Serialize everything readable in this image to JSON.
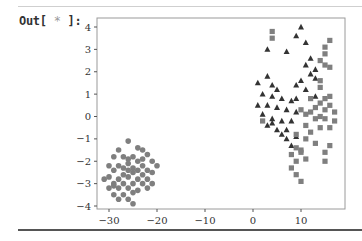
{
  "cell": {
    "prompt_prefix": "Out[",
    "prompt_star": "*",
    "prompt_suffix": "]:"
  },
  "chart_data": {
    "type": "scatter",
    "title": "",
    "xlabel": "",
    "ylabel": "",
    "xlim": [
      -33,
      18
    ],
    "ylim": [
      -4.1,
      4.3
    ],
    "xticks": [
      -30,
      -20,
      -10,
      0,
      10
    ],
    "yticks": [
      4,
      3,
      2,
      1,
      0,
      -1,
      -2,
      -3,
      -4
    ],
    "grid": false,
    "legend": null,
    "series": [
      {
        "name": "circles",
        "marker": "circle",
        "color": "#7f7f7f",
        "points": [
          [
            -26,
            -1.1
          ],
          [
            -28,
            -1.5
          ],
          [
            -24,
            -1.4
          ],
          [
            -23,
            -1.5
          ],
          [
            -22,
            -1.7
          ],
          [
            -25,
            -1.8
          ],
          [
            -27,
            -1.8
          ],
          [
            -29,
            -1.8
          ],
          [
            -26,
            -1.9
          ],
          [
            -23,
            -1.9
          ],
          [
            -21,
            -2.0
          ],
          [
            -20,
            -2.2
          ],
          [
            -24,
            -2.0
          ],
          [
            -26,
            -2.1
          ],
          [
            -28,
            -2.2
          ],
          [
            -30,
            -2.2
          ],
          [
            -27,
            -2.3
          ],
          [
            -25,
            -2.3
          ],
          [
            -23,
            -2.2
          ],
          [
            -22,
            -2.4
          ],
          [
            -29,
            -2.4
          ],
          [
            -25,
            -2.5
          ],
          [
            -27,
            -2.6
          ],
          [
            -30,
            -2.7
          ],
          [
            -31,
            -2.8
          ],
          [
            -28,
            -2.8
          ],
          [
            -26,
            -2.7
          ],
          [
            -24,
            -2.8
          ],
          [
            -22,
            -2.8
          ],
          [
            -23,
            -2.6
          ],
          [
            -29,
            -3.0
          ],
          [
            -27,
            -3.0
          ],
          [
            -25,
            -3.0
          ],
          [
            -23,
            -3.0
          ],
          [
            -21,
            -3.0
          ],
          [
            -30,
            -3.2
          ],
          [
            -28,
            -3.2
          ],
          [
            -26,
            -3.2
          ],
          [
            -24,
            -3.3
          ],
          [
            -22,
            -3.2
          ],
          [
            -29,
            -3.5
          ],
          [
            -27,
            -3.5
          ],
          [
            -25,
            -3.4
          ],
          [
            -28,
            -3.7
          ],
          [
            -26,
            -3.7
          ],
          [
            -25,
            -3.9
          ],
          [
            -29,
            -3.1
          ],
          [
            -24,
            -2.4
          ],
          [
            -21,
            -2.5
          ],
          [
            -26,
            -2.4
          ]
        ]
      },
      {
        "name": "triangles",
        "marker": "triangle",
        "color": "#333333",
        "points": [
          [
            10,
            4.0
          ],
          [
            9,
            3.6
          ],
          [
            11,
            3.3
          ],
          [
            3,
            3.0
          ],
          [
            7,
            2.9
          ],
          [
            12,
            2.6
          ],
          [
            11,
            2.3
          ],
          [
            13,
            2.1
          ],
          [
            12,
            1.9
          ],
          [
            13,
            1.7
          ],
          [
            3,
            1.8
          ],
          [
            1,
            1.5
          ],
          [
            4,
            1.4
          ],
          [
            5,
            1.2
          ],
          [
            9,
            1.4
          ],
          [
            10,
            1.6
          ],
          [
            11,
            1.2
          ],
          [
            2,
            1.0
          ],
          [
            4,
            0.9
          ],
          [
            6,
            0.8
          ],
          [
            8,
            0.7
          ],
          [
            9,
            0.8
          ],
          [
            13,
            0.9
          ],
          [
            1,
            0.5
          ],
          [
            3,
            0.5
          ],
          [
            5,
            0.4
          ],
          [
            7,
            0.3
          ],
          [
            9,
            0.2
          ],
          [
            2,
            0.1
          ],
          [
            4,
            -0.1
          ],
          [
            6,
            -0.2
          ],
          [
            8,
            -0.2
          ],
          [
            3,
            -0.4
          ],
          [
            5,
            -0.6
          ],
          [
            7,
            -0.6
          ],
          [
            6,
            -0.8
          ],
          [
            7,
            -1.0
          ],
          [
            8,
            -1.3
          ],
          [
            9,
            -0.9
          ],
          [
            4,
            -0.3
          ]
        ]
      },
      {
        "name": "squares",
        "marker": "square",
        "color": "#7f7f7f",
        "points": [
          [
            4,
            3.8
          ],
          [
            4,
            3.5
          ],
          [
            16,
            3.4
          ],
          [
            15,
            3.1
          ],
          [
            15,
            2.8
          ],
          [
            14,
            2.5
          ],
          [
            15,
            2.3
          ],
          [
            16,
            2.2
          ],
          [
            14,
            1.6
          ],
          [
            14,
            1.3
          ],
          [
            10,
            0.3
          ],
          [
            11,
            0.1
          ],
          [
            13,
            0.4
          ],
          [
            14,
            0.6
          ],
          [
            15,
            0.8
          ],
          [
            16,
            0.5
          ],
          [
            12,
            0.8
          ],
          [
            15,
            0.3
          ],
          [
            17,
            0.2
          ],
          [
            13,
            -0.1
          ],
          [
            15,
            -0.1
          ],
          [
            14,
            -0.5
          ],
          [
            16,
            -0.5
          ],
          [
            11,
            -0.4
          ],
          [
            12,
            -0.7
          ],
          [
            9,
            -0.8
          ],
          [
            11,
            -1.0
          ],
          [
            13,
            -1.2
          ],
          [
            16,
            -1.3
          ],
          [
            15,
            -1.6
          ],
          [
            9,
            -1.4
          ],
          [
            10,
            -1.5
          ],
          [
            8,
            -1.7
          ],
          [
            10,
            -1.6
          ],
          [
            11,
            -1.9
          ],
          [
            9,
            -2.0
          ],
          [
            8,
            -2.3
          ],
          [
            9,
            -2.6
          ],
          [
            10,
            -2.9
          ],
          [
            2,
            -0.2
          ],
          [
            14,
            0.0
          ],
          [
            16,
            0.9
          ],
          [
            12,
            0.2
          ],
          [
            17,
            -0.2
          ],
          [
            15,
            -2.0
          ]
        ]
      }
    ]
  }
}
